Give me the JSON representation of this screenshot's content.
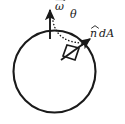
{
  "figure": {
    "background_color": "#ffffff",
    "ink_color": "#1a1a1a",
    "width": 125,
    "height": 124,
    "labels": {
      "omega": "ω",
      "theta": "θ",
      "n_hat": "n",
      "dA": "dA"
    },
    "elements": {
      "circle_name": "sphere-outline",
      "omega_vector_name": "angular-velocity-vector",
      "normal_vector_name": "surface-normal-vector",
      "area_patch_name": "area-element-patch",
      "angle_arc_name": "angle-arc-dotted"
    }
  },
  "chart_data": {
    "type": "diagram",
    "shapes": [
      {
        "name": "sphere-outline",
        "kind": "circle",
        "cx": 54.5,
        "cy": 71.5,
        "r": 41.0,
        "stroke_width": 2.1,
        "fill": "none"
      },
      {
        "name": "angular-velocity-vector",
        "kind": "arrow",
        "x1": 50.0,
        "y1": 39.0,
        "x2": 50.0,
        "y2": 10.0,
        "stroke_width": 1.9,
        "label": "ω"
      },
      {
        "name": "surface-normal-vector",
        "kind": "arrow",
        "x1": 61.0,
        "y1": 60.0,
        "x2": 90.0,
        "y2": 39.0,
        "stroke_width": 1.9,
        "label": "n dA"
      },
      {
        "name": "angle-arc-dotted",
        "kind": "dotted-arc",
        "x1": 53.0,
        "y1": 21.0,
        "x2": 87.0,
        "y2": 43.0,
        "cx": 57.0,
        "cy": 44.0,
        "label": "θ"
      },
      {
        "name": "area-element-patch",
        "kind": "quadrilateral",
        "points": "63,56 67,45 79,48 75,60"
      }
    ],
    "annotations": [
      {
        "text": "ω",
        "x": 60,
        "y": 6,
        "accent": "vector-arrow"
      },
      {
        "text": "θ",
        "x": 74,
        "y": 15,
        "accent": "none"
      },
      {
        "text": "n dA",
        "x": 104,
        "y": 34,
        "accent": "hat-on-n"
      }
    ]
  }
}
